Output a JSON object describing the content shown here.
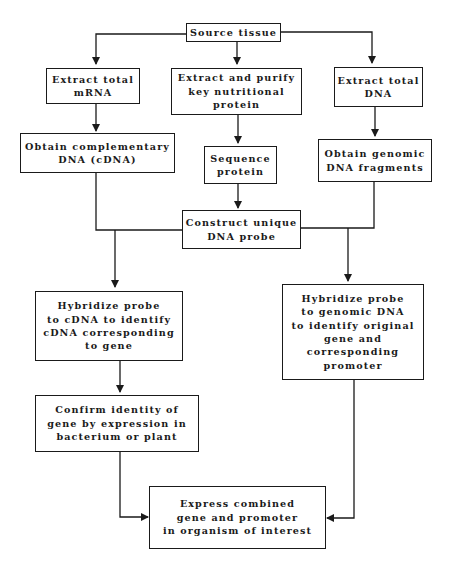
{
  "diagram": {
    "type": "flowchart",
    "nodes": {
      "source": {
        "label": "Source tissue"
      },
      "extract_mrna": {
        "label": "Extract total\nmRNA"
      },
      "extract_protein": {
        "label": "Extract and purify\nkey nutritional\nprotein"
      },
      "extract_dna": {
        "label": "Extract total\nDNA"
      },
      "obtain_cdna": {
        "label": "Obtain complementary\nDNA (cDNA)"
      },
      "sequence_protein": {
        "label": "Sequence\nprotein"
      },
      "obtain_genomic": {
        "label": "Obtain genomic\nDNA fragments"
      },
      "construct_probe": {
        "label": "Construct unique\nDNA probe"
      },
      "hybridize_cdna": {
        "label": "Hybridize probe\nto cDNA to identify\ncDNA corresponding\nto gene"
      },
      "hybridize_genomic": {
        "label": "Hybridize probe\nto genomic DNA\nto identify original\ngene and\ncorresponding\npromoter"
      },
      "confirm_identity": {
        "label": "Confirm identity of\ngene by expression in\nbacterium or plant"
      },
      "express_combined": {
        "label": "Express combined\ngene and promoter\nin organism of interest"
      }
    },
    "edges": [
      {
        "from": "source",
        "to": "extract_mrna"
      },
      {
        "from": "source",
        "to": "extract_protein"
      },
      {
        "from": "source",
        "to": "extract_dna"
      },
      {
        "from": "extract_mrna",
        "to": "obtain_cdna"
      },
      {
        "from": "extract_protein",
        "to": "sequence_protein"
      },
      {
        "from": "extract_dna",
        "to": "obtain_genomic"
      },
      {
        "from": "sequence_protein",
        "to": "construct_probe"
      },
      {
        "from": "obtain_cdna",
        "to": "construct_probe"
      },
      {
        "from": "obtain_genomic",
        "to": "construct_probe"
      },
      {
        "from": "construct_probe",
        "to": "hybridize_cdna"
      },
      {
        "from": "construct_probe",
        "to": "hybridize_genomic"
      },
      {
        "from": "hybridize_cdna",
        "to": "confirm_identity"
      },
      {
        "from": "confirm_identity",
        "to": "express_combined"
      },
      {
        "from": "hybridize_genomic",
        "to": "express_combined"
      }
    ],
    "colors": {
      "line": "#1a1a1a",
      "background": "#ffffff"
    }
  }
}
